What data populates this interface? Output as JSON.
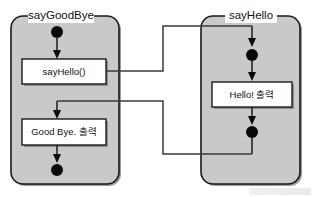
{
  "diagram": {
    "type": "uml-activity-diagram",
    "background_color": "#ffffff",
    "panel_fill": "#c9c9c9",
    "box_fill": "#ffffff",
    "line_color": "#1a1a1a",
    "node_color": "#0a0a0a",
    "panels": [
      {
        "id": "say-good-bye",
        "title": "sayGoodBye",
        "nodes": [
          {
            "kind": "start-node",
            "name": "start-node-saygoodbye"
          },
          {
            "kind": "action",
            "name": "action-sayhello-call",
            "label": "sayHello()"
          },
          {
            "kind": "action",
            "name": "action-goodbye-print",
            "label": "Good Bye. 출력"
          },
          {
            "kind": "end-node",
            "name": "end-node-saygoodbye"
          }
        ]
      },
      {
        "id": "say-hello",
        "title": "sayHello",
        "nodes": [
          {
            "kind": "start-node",
            "name": "start-node-sayhello"
          },
          {
            "kind": "action",
            "name": "action-hello-print",
            "label": "Hello! 출력"
          },
          {
            "kind": "end-node",
            "name": "end-node-sayhello"
          }
        ]
      }
    ],
    "connectors": [
      {
        "name": "call-connector",
        "from": "action-sayhello-call",
        "to": "start-node-sayhello",
        "label": ""
      },
      {
        "name": "return-connector",
        "from": "end-node-sayhello",
        "to": "action-goodbye-print",
        "label": ""
      }
    ]
  }
}
